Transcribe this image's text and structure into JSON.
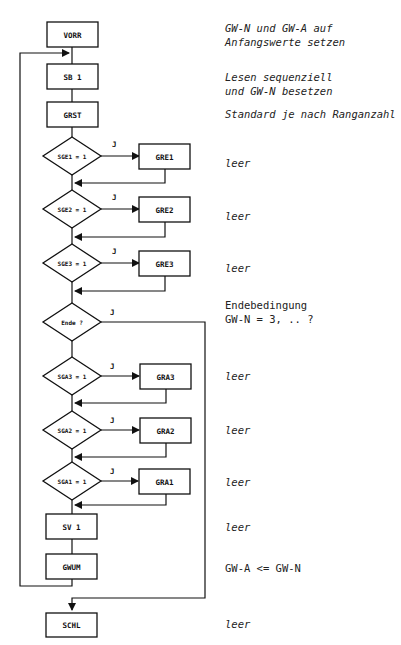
{
  "diagram": {
    "type": "flowchart",
    "title_cut": "",
    "nodes": {
      "vorr": "VORR",
      "sb1": "SB 1",
      "grst": "GRST",
      "sge1": "SGE1 = 1",
      "gre1": "GRE1",
      "sge2": "SGE2 = 1",
      "gre2": "GRE2",
      "sge3": "SGE3 = 1",
      "gre3": "GRE3",
      "ende": "Ende ?",
      "sga3": "SGA3 = 1",
      "gra3": "GRA3",
      "sga2": "SGA2 = 1",
      "gra2": "GRA2",
      "sga1": "SGA1 = 1",
      "gra1": "GRA1",
      "sv1": "SV 1",
      "gwum": "GWUM",
      "schl": "SCHL"
    },
    "yes_label": "J",
    "annotations": {
      "vorr": [
        "GW-N und GW-A auf",
        "Anfangswerte setzen"
      ],
      "sb1": [
        "Lesen sequenziell",
        "und GW-N besetzen"
      ],
      "grst": [
        "Standard je nach Ranganzahl"
      ],
      "gre1": [
        "leer"
      ],
      "gre2": [
        "leer"
      ],
      "gre3": [
        "leer"
      ],
      "ende": [
        "Endebedingung",
        "GW-N = 3, .. ?"
      ],
      "gra3": [
        "leer"
      ],
      "gra2": [
        "leer"
      ],
      "gra1": [
        "leer"
      ],
      "sv1": [
        "leer"
      ],
      "gwum": [
        "GW-A <= GW-N"
      ],
      "schl": [
        "leer"
      ]
    },
    "colors": {
      "line": "#111111",
      "text": "#222222",
      "background": "#ffffff"
    }
  }
}
